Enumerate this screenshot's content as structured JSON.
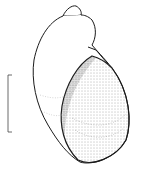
{
  "figure": {
    "style": "pen-and-ink stipple drawing",
    "background_color": "#ffffff",
    "line_color": "#1a1a1a",
    "scale_bar": {
      "label": ""
    }
  }
}
